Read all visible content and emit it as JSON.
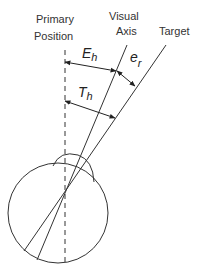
{
  "diagram": {
    "type": "eye-gaze-geometry",
    "labels": {
      "primary_line1": "Primary",
      "primary_line2": "Position",
      "visual_line1": "Visual",
      "visual_line2": "Axis",
      "target": "Target"
    },
    "symbols": {
      "eye_h_main": "E",
      "eye_h_sub": "h",
      "err_main": "e",
      "err_sub": "r",
      "target_h_main": "T",
      "target_h_sub": "h"
    },
    "colors": {
      "stroke": "#333333",
      "background": "#ffffff"
    }
  }
}
